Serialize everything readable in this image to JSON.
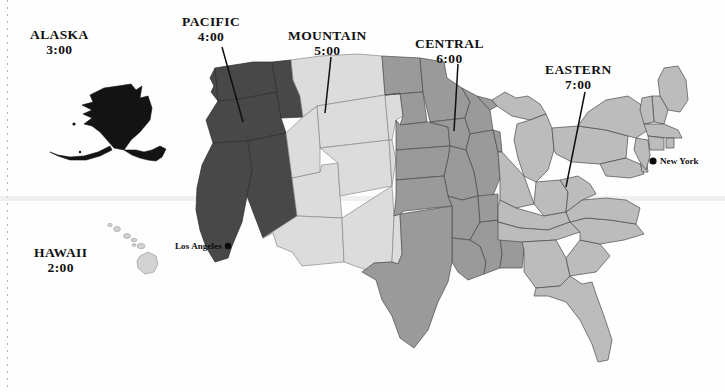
{
  "map": {
    "title_context": "United States Time Zones",
    "background_color": "#fefefe",
    "border_color": "#3c3c3c"
  },
  "zone_colors": {
    "pacific": "#484848",
    "mountain": "#dcdcdc",
    "central": "#9a9a9a",
    "eastern": "#bcbcbc",
    "alaska": "#131313",
    "hawaii": "#d2d2d2"
  },
  "zones": [
    {
      "id": "alaska",
      "name": "ALASKA",
      "time": "3:00",
      "label_x": 30,
      "label_y": 27,
      "has_leader": false
    },
    {
      "id": "pacific",
      "name": "PACIFIC",
      "time": "4:00",
      "label_x": 182,
      "label_y": 14,
      "has_leader": true
    },
    {
      "id": "mountain",
      "name": "MOUNTAIN",
      "time": "5:00",
      "label_x": 288,
      "label_y": 28,
      "has_leader": true
    },
    {
      "id": "central",
      "name": "CENTRAL",
      "time": "6:00",
      "label_x": 415,
      "label_y": 36,
      "has_leader": true
    },
    {
      "id": "eastern",
      "name": "EASTERN",
      "time": "7:00",
      "label_x": 545,
      "label_y": 62,
      "has_leader": true
    },
    {
      "id": "hawaii",
      "name": "HAWAII",
      "time": "2:00",
      "label_x": 34,
      "label_y": 245,
      "has_leader": false
    }
  ],
  "cities": [
    {
      "id": "new-york",
      "name": "New York",
      "dot_x": 653,
      "dot_y": 161,
      "label_x": 660,
      "label_y": 156,
      "align": "left"
    },
    {
      "id": "los-angeles",
      "name": "Los Angeles",
      "dot_x": 228,
      "dot_y": 246,
      "label_x": 175,
      "label_y": 248,
      "align": "right"
    }
  ],
  "leader_lines": [
    {
      "zone": "pacific",
      "x1": 222,
      "y1": 47,
      "x2": 243,
      "y2": 122
    },
    {
      "zone": "mountain",
      "x1": 331,
      "y1": 57,
      "x2": 325,
      "y2": 113
    },
    {
      "zone": "central",
      "x1": 458,
      "y1": 64,
      "x2": 454,
      "y2": 131
    },
    {
      "zone": "eastern",
      "x1": 585,
      "y1": 92,
      "x2": 566,
      "y2": 187
    }
  ]
}
